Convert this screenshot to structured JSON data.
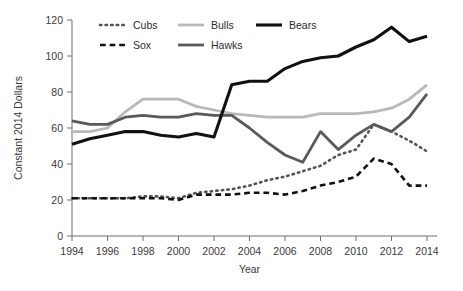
{
  "chart_data": {
    "type": "line",
    "title": "",
    "xlabel": "Year",
    "ylabel": "Constant 2014 Dollars",
    "xlim": [
      1994,
      2014
    ],
    "ylim": [
      0,
      120
    ],
    "ytick_values": [
      0,
      20,
      40,
      60,
      80,
      100,
      120
    ],
    "ytick_labels": [
      "0",
      "20",
      "40",
      "60",
      "80",
      "100",
      "120"
    ],
    "xtick_values": [
      1994,
      1996,
      1998,
      2000,
      2002,
      2004,
      2006,
      2008,
      2010,
      2012,
      2014
    ],
    "xtick_labels": [
      "1994",
      "1996",
      "1998",
      "2000",
      "2002",
      "2004",
      "2006",
      "2008",
      "2010",
      "2012",
      "2014"
    ],
    "grid": false,
    "legend_position": "top",
    "x": [
      1994,
      1995,
      1996,
      1997,
      1998,
      1999,
      2000,
      2001,
      2002,
      2003,
      2004,
      2005,
      2006,
      2007,
      2008,
      2009,
      2010,
      2011,
      2012,
      2013,
      2014
    ],
    "series": [
      {
        "name": "Cubs",
        "color": "#555555",
        "style": "dotted",
        "width": 2.6,
        "values": [
          21,
          21,
          21,
          21,
          22,
          22,
          21,
          24,
          25,
          26,
          28,
          31,
          33,
          36,
          39,
          45,
          48,
          62,
          58,
          53,
          47
        ]
      },
      {
        "name": "Sox",
        "color": "#111111",
        "style": "dashed",
        "width": 2.6,
        "values": [
          21,
          21,
          21,
          21,
          21,
          21,
          20,
          23,
          23,
          23,
          24,
          24,
          23,
          25,
          28,
          30,
          33,
          43,
          40,
          28,
          28
        ]
      },
      {
        "name": "Bulls",
        "color": "#b9b9b9",
        "style": "solid",
        "width": 2.8,
        "values": [
          58,
          58,
          60,
          69,
          76,
          76,
          76,
          72,
          70,
          68,
          67,
          66,
          66,
          66,
          68,
          68,
          68,
          69,
          71,
          76,
          84
        ]
      },
      {
        "name": "Hawks",
        "color": "#5a5a5a",
        "style": "solid",
        "width": 2.8,
        "values": [
          64,
          62,
          62,
          66,
          67,
          66,
          66,
          68,
          67,
          67,
          60,
          52,
          45,
          41,
          58,
          48,
          56,
          62,
          58,
          66,
          79
        ]
      },
      {
        "name": "Bears",
        "color": "#111111",
        "style": "solid",
        "width": 3.1,
        "values": [
          51,
          54,
          56,
          58,
          58,
          56,
          55,
          57,
          55,
          84,
          86,
          86,
          93,
          97,
          99,
          100,
          105,
          109,
          116,
          108,
          111
        ]
      }
    ]
  },
  "legend": {
    "items": [
      {
        "label": "Cubs"
      },
      {
        "label": "Bulls"
      },
      {
        "label": "Bears"
      },
      {
        "label": "Sox"
      },
      {
        "label": "Hawks"
      }
    ]
  }
}
